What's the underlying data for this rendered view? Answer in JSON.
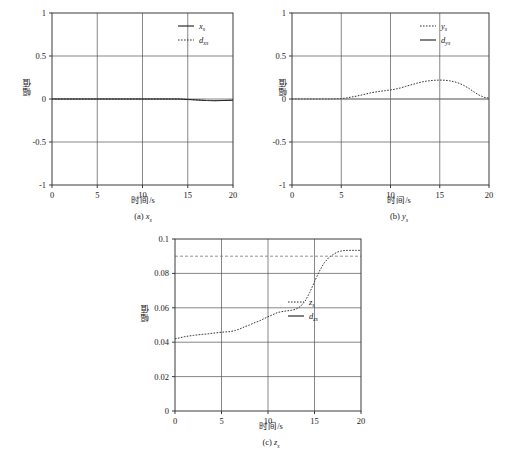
{
  "figure": {
    "background": "#ffffff",
    "axis_color": "#3a3a3a",
    "grid_color": "#555555",
    "series_solid_color": "#1a1a1a",
    "series_dashed_color": "#333333",
    "reference_color": "#777777"
  },
  "common": {
    "xlabel": "时间/s",
    "ylabel": "幅值"
  },
  "panels": [
    {
      "id": "panel-a",
      "caption_prefix": "(a) ",
      "caption_var": "x",
      "caption_sub": "s",
      "legend": [
        {
          "label_var": "x",
          "label_sub": "s",
          "style": "solid"
        },
        {
          "label_var": "d",
          "label_sub": "xs",
          "style": "dashed"
        }
      ]
    },
    {
      "id": "panel-b",
      "caption_prefix": "(b) ",
      "caption_var": "y",
      "caption_sub": "s",
      "legend": [
        {
          "label_var": "y",
          "label_sub": "s",
          "style": "dashed"
        },
        {
          "label_var": "d",
          "label_sub": "ys",
          "style": "solid"
        }
      ]
    },
    {
      "id": "panel-c",
      "caption_prefix": "(c) ",
      "caption_var": "z",
      "caption_sub": "s",
      "legend": [
        {
          "label_var": "z",
          "label_sub": "s",
          "style": "dashed"
        },
        {
          "label_var": "d",
          "label_sub": "zs",
          "style": "solid"
        }
      ]
    }
  ],
  "chart_data": [
    {
      "type": "line",
      "id": "panel-a",
      "title": "(a) x_s",
      "xlabel": "时间/s",
      "ylabel": "幅值",
      "xlim": [
        0,
        20
      ],
      "ylim": [
        -1,
        1
      ],
      "xticks": [
        0,
        5,
        10,
        15,
        20
      ],
      "yticks": [
        -1,
        -0.5,
        0,
        0.5,
        1
      ],
      "xticklabels": [
        "0",
        "5",
        "10",
        "15",
        "20"
      ],
      "yticklabels": [
        "-1",
        "-0.5",
        "0",
        "0.5",
        "1"
      ],
      "grid": true,
      "legend_position": "top-right",
      "series": [
        {
          "name": "x_s",
          "style": "solid",
          "x": [
            0,
            1,
            2,
            3,
            4,
            5,
            6,
            7,
            8,
            9,
            10,
            11,
            12,
            13,
            14,
            15,
            16,
            17,
            18,
            19,
            20
          ],
          "values": [
            0.0,
            0.0,
            0.0,
            0.0,
            0.0,
            0.0,
            0.0,
            0.0,
            0.0,
            0.0,
            0.0,
            0.0,
            0.0,
            0.0,
            0.0,
            -0.005,
            -0.012,
            -0.018,
            -0.02,
            -0.018,
            -0.015
          ]
        },
        {
          "name": "d_xs",
          "style": "dashed",
          "x": [
            0,
            1,
            2,
            3,
            4,
            5,
            6,
            7,
            8,
            9,
            10,
            11,
            12,
            13,
            14,
            15,
            16,
            17,
            18,
            19,
            20
          ],
          "values": [
            0.0,
            0.0,
            0.0,
            0.0,
            0.0,
            0.0,
            0.0,
            0.0,
            0.0,
            0.0,
            0.0,
            0.0,
            0.0,
            0.0,
            0.0,
            -0.004,
            -0.01,
            -0.016,
            -0.018,
            -0.016,
            -0.013
          ]
        }
      ]
    },
    {
      "type": "line",
      "id": "panel-b",
      "title": "(b) y_s",
      "xlabel": "时间/s",
      "ylabel": "幅值",
      "xlim": [
        0,
        20
      ],
      "ylim": [
        -1,
        1
      ],
      "xticks": [
        0,
        5,
        10,
        15,
        20
      ],
      "yticks": [
        -1,
        -0.5,
        0,
        0.5,
        1
      ],
      "xticklabels": [
        "0",
        "5",
        "10",
        "15",
        "20"
      ],
      "yticklabels": [
        "-1",
        "-0.5",
        "0",
        "0.5",
        "1"
      ],
      "grid": true,
      "legend_position": "top-right",
      "series": [
        {
          "name": "y_s",
          "style": "dashed",
          "x": [
            0,
            1,
            2,
            3,
            4,
            5,
            5.5,
            6,
            6.5,
            7,
            7.5,
            8,
            8.5,
            9,
            9.5,
            10,
            10.5,
            11,
            11.5,
            12,
            12.5,
            13,
            13.5,
            14,
            14.5,
            15,
            15.5,
            16,
            16.5,
            17,
            17.5,
            18,
            18.5,
            19,
            19.5,
            20
          ],
          "values": [
            0.0,
            0.0,
            0.0,
            0.0,
            0.0,
            0.005,
            0.012,
            0.022,
            0.032,
            0.045,
            0.058,
            0.072,
            0.082,
            0.09,
            0.098,
            0.105,
            0.115,
            0.128,
            0.145,
            0.162,
            0.178,
            0.193,
            0.205,
            0.213,
            0.218,
            0.22,
            0.218,
            0.212,
            0.2,
            0.182,
            0.155,
            0.12,
            0.08,
            0.045,
            0.02,
            0.01
          ]
        },
        {
          "name": "d_ys",
          "style": "solid",
          "x": [
            0,
            20
          ],
          "values": [
            0.0,
            0.0
          ]
        }
      ]
    },
    {
      "type": "line",
      "id": "panel-c",
      "title": "(c) z_s",
      "xlabel": "时间/s",
      "ylabel": "幅值",
      "xlim": [
        0,
        20
      ],
      "ylim": [
        0,
        0.1
      ],
      "xticks": [
        0,
        5,
        10,
        15,
        20
      ],
      "yticks": [
        0,
        0.02,
        0.04,
        0.06,
        0.08,
        0.1
      ],
      "xticklabels": [
        "0",
        "5",
        "10",
        "15",
        "20"
      ],
      "yticklabels": [
        "0",
        "0.02",
        "0.04",
        "0.06",
        "0.08",
        "0.1"
      ],
      "grid": true,
      "legend_position": "center-right",
      "series": [
        {
          "name": "z_s",
          "style": "dashed",
          "x": [
            0,
            0.5,
            1,
            1.5,
            2,
            2.5,
            3,
            3.5,
            4,
            4.5,
            5,
            5.5,
            6,
            6.5,
            7,
            7.5,
            8,
            8.5,
            9,
            9.5,
            10,
            10.5,
            11,
            11.5,
            12,
            12.5,
            13,
            13.5,
            14,
            14.5,
            15,
            15.5,
            16,
            16.5,
            17,
            17.5,
            18,
            18.5,
            19,
            19.5,
            20
          ],
          "values": [
            0.042,
            0.0425,
            0.0432,
            0.0436,
            0.044,
            0.0443,
            0.0446,
            0.0448,
            0.0452,
            0.0455,
            0.0458,
            0.046,
            0.0462,
            0.0468,
            0.0478,
            0.049,
            0.05,
            0.0512,
            0.0522,
            0.0535,
            0.0548,
            0.056,
            0.0572,
            0.0578,
            0.0582,
            0.0585,
            0.0592,
            0.0608,
            0.064,
            0.069,
            0.0752,
            0.081,
            0.0858,
            0.089,
            0.091,
            0.0925,
            0.0932,
            0.0934,
            0.0934,
            0.0934,
            0.0934
          ]
        },
        {
          "name": "d_zs",
          "style": "solid",
          "x": [
            0,
            20
          ],
          "values": [
            0.09,
            0.09
          ]
        }
      ]
    }
  ]
}
